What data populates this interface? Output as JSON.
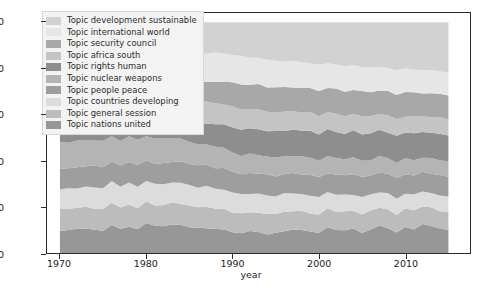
{
  "chart_data": {
    "type": "area",
    "title": "",
    "xlabel": "year",
    "ylabel": "",
    "xlim": [
      1968.5,
      2017.5
    ],
    "ylim": [
      0,
      104
    ],
    "grid": false,
    "stacked": true,
    "normalized_percent": true,
    "legend_position": "upper-left-inside",
    "xticks": [
      1970,
      1980,
      1990,
      2000,
      2010
    ],
    "xticklabels": [
      "1970",
      "1980",
      "1990",
      "2000",
      "2010"
    ],
    "yticks": [
      0,
      20,
      40,
      60,
      80,
      100
    ],
    "yticklabels": [
      "0",
      "20",
      "40",
      "60",
      "80",
      "100"
    ],
    "x": [
      1970,
      1971,
      1972,
      1973,
      1974,
      1975,
      1976,
      1977,
      1978,
      1979,
      1980,
      1981,
      1982,
      1983,
      1984,
      1985,
      1986,
      1987,
      1988,
      1989,
      1990,
      1991,
      1992,
      1993,
      1994,
      1995,
      1996,
      1997,
      1998,
      1999,
      2000,
      2001,
      2002,
      2003,
      2004,
      2005,
      2006,
      2007,
      2008,
      2009,
      2010,
      2011,
      2012,
      2013,
      2014,
      2015
    ],
    "series": [
      {
        "name": "Topic development sustainable",
        "color": "#d2d2d2",
        "stack_order": 10,
        "values": [
          17.0,
          16.5,
          16.2,
          16.8,
          16.0,
          15.6,
          15.2,
          15.5,
          15.0,
          14.6,
          14.2,
          14.8,
          14.4,
          14.0,
          13.6,
          13.2,
          13.8,
          13.4,
          13.0,
          13.6,
          14.2,
          14.8,
          15.4,
          16.0,
          16.6,
          17.2,
          17.8,
          17.4,
          18.0,
          18.6,
          19.2,
          18.8,
          19.4,
          20.0,
          19.6,
          20.2,
          20.8,
          20.4,
          21.0,
          21.6,
          21.2,
          21.8,
          22.4,
          22.0,
          22.6,
          23.0
        ]
      },
      {
        "name": "Topic international world",
        "color": "#e6e6e6",
        "stack_order": 9,
        "values": [
          12.0,
          12.4,
          12.0,
          11.6,
          12.2,
          11.8,
          12.4,
          12.0,
          11.6,
          12.2,
          11.8,
          11.4,
          12.0,
          11.6,
          12.2,
          12.8,
          12.4,
          12.0,
          12.6,
          12.2,
          11.8,
          12.4,
          12.0,
          11.6,
          12.2,
          11.8,
          11.4,
          12.0,
          11.6,
          11.2,
          11.8,
          11.4,
          11.0,
          11.6,
          11.2,
          10.8,
          11.4,
          11.0,
          10.6,
          11.2,
          10.8,
          10.4,
          11.0,
          10.6,
          10.2,
          10.6
        ]
      },
      {
        "name": "Topic security council",
        "color": "#a8a8a8",
        "stack_order": 8,
        "values": [
          6.4,
          6.0,
          6.6,
          6.2,
          5.8,
          6.4,
          6.0,
          6.6,
          6.2,
          6.8,
          6.4,
          7.0,
          6.6,
          7.2,
          6.8,
          7.4,
          8.0,
          8.6,
          9.2,
          9.8,
          10.4,
          11.0,
          10.6,
          11.2,
          10.8,
          11.4,
          11.0,
          10.6,
          11.2,
          10.8,
          11.4,
          11.0,
          11.6,
          11.2,
          10.8,
          11.4,
          11.0,
          10.6,
          11.2,
          10.8,
          11.4,
          11.0,
          10.6,
          11.2,
          10.8,
          11.0
        ]
      },
      {
        "name": "Topic africa south",
        "color": "#c4c4c4",
        "stack_order": 7,
        "values": [
          10.5,
          10.9,
          10.4,
          10.0,
          10.6,
          10.2,
          9.8,
          10.4,
          10.0,
          9.6,
          10.2,
          9.8,
          10.4,
          10.0,
          9.6,
          9.2,
          9.8,
          9.4,
          9.0,
          8.6,
          9.2,
          8.8,
          8.4,
          9.0,
          8.6,
          8.2,
          8.8,
          8.4,
          8.0,
          8.6,
          8.2,
          7.8,
          8.4,
          8.0,
          7.6,
          8.2,
          7.8,
          7.4,
          8.0,
          7.6,
          7.2,
          7.8,
          7.4,
          7.0,
          7.6,
          7.4
        ]
      },
      {
        "name": "Topic rights human",
        "color": "#8e8e8e",
        "stack_order": 6,
        "values": [
          6.0,
          6.4,
          6.0,
          6.6,
          6.2,
          6.8,
          6.4,
          7.0,
          6.6,
          7.2,
          6.8,
          7.4,
          7.0,
          7.6,
          8.2,
          8.8,
          8.4,
          9.0,
          9.6,
          10.2,
          10.8,
          11.4,
          11.0,
          11.6,
          11.2,
          11.8,
          11.4,
          12.0,
          11.6,
          12.2,
          11.8,
          12.4,
          12.0,
          11.6,
          12.2,
          11.8,
          12.4,
          12.0,
          11.6,
          12.2,
          11.8,
          12.4,
          12.0,
          11.6,
          12.2,
          12.0
        ]
      },
      {
        "name": "Topic nuclear weapons",
        "color": "#b4b4b4",
        "stack_order": 5,
        "values": [
          11.5,
          11.1,
          11.6,
          11.2,
          10.8,
          11.4,
          11.0,
          10.6,
          11.2,
          10.8,
          10.4,
          11.0,
          10.6,
          10.2,
          9.8,
          9.4,
          9.0,
          8.6,
          9.2,
          8.8,
          8.4,
          8.0,
          8.6,
          8.2,
          7.8,
          8.4,
          8.0,
          7.6,
          8.2,
          7.8,
          7.4,
          8.0,
          7.6,
          7.2,
          7.8,
          7.4,
          7.0,
          7.6,
          7.2,
          6.8,
          7.4,
          7.0,
          6.6,
          7.2,
          6.8,
          7.0
        ]
      },
      {
        "name": "Topic people peace",
        "color": "#9e9e9e",
        "stack_order": 4,
        "values": [
          9.0,
          8.6,
          9.2,
          8.8,
          9.4,
          9.0,
          8.6,
          9.2,
          8.8,
          9.4,
          9.0,
          8.6,
          9.2,
          8.8,
          9.4,
          9.0,
          9.6,
          9.2,
          8.8,
          9.4,
          9.0,
          8.6,
          9.2,
          8.8,
          9.4,
          9.0,
          8.6,
          9.2,
          8.8,
          9.4,
          9.0,
          8.6,
          9.2,
          8.8,
          9.4,
          9.0,
          8.6,
          9.2,
          8.8,
          9.4,
          9.0,
          8.6,
          9.2,
          8.8,
          9.4,
          9.0
        ]
      },
      {
        "name": "Topic countries developing",
        "color": "#dcdcdc",
        "stack_order": 3,
        "values": [
          8.5,
          8.9,
          8.4,
          8.8,
          9.2,
          8.8,
          9.4,
          9.0,
          9.6,
          9.2,
          8.8,
          9.4,
          9.0,
          8.6,
          9.2,
          8.8,
          8.4,
          9.0,
          8.6,
          8.2,
          8.8,
          8.4,
          8.0,
          8.6,
          8.2,
          7.8,
          8.4,
          8.0,
          7.6,
          8.2,
          7.8,
          7.4,
          8.0,
          7.6,
          7.2,
          7.8,
          7.4,
          7.0,
          7.6,
          7.2,
          6.8,
          7.4,
          7.0,
          6.6,
          7.2,
          7.0
        ]
      },
      {
        "name": "Topic general session",
        "color": "#bcbcbc",
        "stack_order": 2,
        "values": [
          9.6,
          9.2,
          9.0,
          9.4,
          9.0,
          9.4,
          9.8,
          9.2,
          9.6,
          9.0,
          9.4,
          8.8,
          9.2,
          9.6,
          9.0,
          9.4,
          8.8,
          9.2,
          8.6,
          9.0,
          8.4,
          8.8,
          8.2,
          8.6,
          9.0,
          8.4,
          8.8,
          8.2,
          8.6,
          8.0,
          8.4,
          8.8,
          8.2,
          8.6,
          8.0,
          8.4,
          8.8,
          8.2,
          8.6,
          8.0,
          8.4,
          8.8,
          8.2,
          8.6,
          8.0,
          8.4
        ]
      },
      {
        "name": "Topic nations united",
        "color": "#979797",
        "stack_order": 1,
        "values": [
          9.5,
          10.0,
          10.6,
          10.6,
          10.0,
          9.6,
          12.2,
          10.5,
          11.4,
          10.2,
          13.0,
          11.8,
          11.6,
          12.4,
          12.2,
          11.0,
          10.8,
          10.6,
          10.4,
          10.2,
          9.0,
          8.6,
          9.6,
          9.4,
          8.2,
          9.0,
          9.8,
          10.6,
          10.4,
          9.8,
          9.0,
          11.8,
          10.6,
          10.4,
          11.2,
          9.0,
          10.8,
          12.6,
          11.4,
          9.2,
          12.0,
          10.8,
          13.6,
          12.4,
          11.2,
          10.6
        ]
      }
    ]
  },
  "legend": {
    "items": [
      {
        "label": "Topic development sustainable",
        "color": "#d2d2d2"
      },
      {
        "label": "Topic international world",
        "color": "#e6e6e6"
      },
      {
        "label": "Topic security council",
        "color": "#a8a8a8"
      },
      {
        "label": "Topic africa south",
        "color": "#c4c4c4"
      },
      {
        "label": "Topic rights human",
        "color": "#8e8e8e"
      },
      {
        "label": "Topic nuclear weapons",
        "color": "#b4b4b4"
      },
      {
        "label": "Topic people peace",
        "color": "#9e9e9e"
      },
      {
        "label": "Topic countries developing",
        "color": "#dcdcdc"
      },
      {
        "label": "Topic general session",
        "color": "#bcbcbc"
      },
      {
        "label": "Topic nations united",
        "color": "#979797"
      }
    ]
  }
}
